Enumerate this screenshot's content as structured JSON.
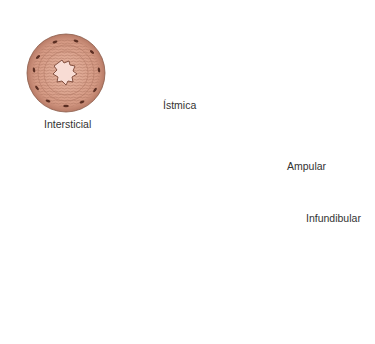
{
  "figure": {
    "cross_sections": [
      {
        "id": "intersticial",
        "label": "Intersticial"
      },
      {
        "id": "istmica",
        "label": "Ístmica"
      },
      {
        "id": "ampular",
        "label": "Ampular"
      }
    ],
    "segment_labels": {
      "infundibular": "Infundibular"
    },
    "colors": {
      "tissue_pink": "#d9a08a",
      "tissue_ring": "#c98a74",
      "mucosa_dark": "#5a2e22",
      "lumen_light": "#f6d4cc",
      "tube_beige": "#e6c7a8",
      "tube_outline": "#7a5a48",
      "ovary_yellow": "#e8e070",
      "uterus_pink": "#f2a38c",
      "uterus_light": "#fbe6d6"
    }
  }
}
